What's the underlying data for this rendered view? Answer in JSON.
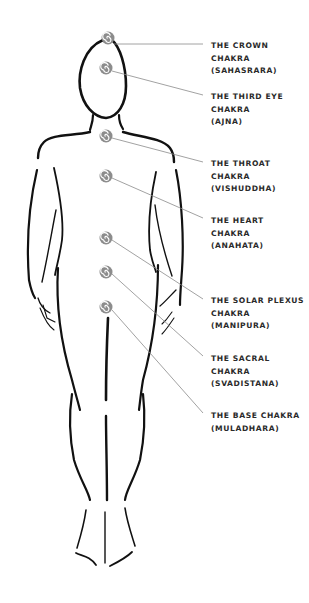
{
  "diagram": {
    "line_color": "#8a8a8a",
    "body_color": "#111111",
    "symbol_color": "#8c8c8c",
    "chakras": [
      {
        "name": "THE CROWN",
        "line2": "CHAKRA",
        "sanskrit": "(SAHASRARA)",
        "icon": "spiral-icon",
        "symbol": {
          "x": 108,
          "y": 38
        },
        "label_y": 40
      },
      {
        "name": "THE THIRD EYE",
        "line2": "CHAKRA",
        "sanskrit": "(AJNA)",
        "icon": "spiral-icon",
        "symbol": {
          "x": 106,
          "y": 68
        },
        "label_y": 91
      },
      {
        "name": "THE THROAT",
        "line2": "CHAKRA",
        "sanskrit": "(VISHUDDHA)",
        "icon": "spiral-icon",
        "symbol": {
          "x": 106,
          "y": 136
        },
        "label_y": 158
      },
      {
        "name": "THE HEART",
        "line2": "CHAKRA",
        "sanskrit": "(ANAHATA)",
        "icon": "spiral-icon",
        "symbol": {
          "x": 106,
          "y": 176
        },
        "label_y": 215
      },
      {
        "name": "THE SOLAR PLEXUS",
        "line2": "CHAKRA",
        "sanskrit": "(MANIPURA)",
        "icon": "spiral-icon",
        "symbol": {
          "x": 106,
          "y": 238
        },
        "label_y": 295
      },
      {
        "name": "THE SACRAL",
        "line2": "CHAKRA",
        "sanskrit": "(SVADISTANA)",
        "icon": "spiral-icon",
        "symbol": {
          "x": 106,
          "y": 272
        },
        "label_y": 353
      },
      {
        "name": "THE BASE CHAKRA",
        "line2": "(MULADHARA)",
        "sanskrit": "",
        "icon": "spiral-icon",
        "symbol": {
          "x": 106,
          "y": 307
        },
        "label_y": 410
      }
    ]
  }
}
